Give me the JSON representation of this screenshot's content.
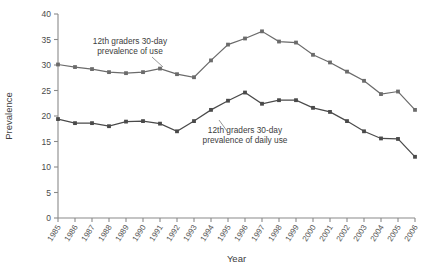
{
  "chart_data": {
    "type": "line",
    "title": "",
    "xlabel": "Year",
    "ylabel": "Prevalence",
    "x": [
      1985,
      1986,
      1987,
      1988,
      1989,
      1990,
      1991,
      1992,
      1993,
      1994,
      1995,
      1996,
      1997,
      1998,
      1999,
      2000,
      2001,
      2002,
      2003,
      2004,
      2005,
      2006
    ],
    "xtick_labels": [
      "1985",
      "1986",
      "1987",
      "1988",
      "1989",
      "1990",
      "1991",
      "1992",
      "1993",
      "1994",
      "1995",
      "1996",
      "1997",
      "1998",
      "1999",
      "2000",
      "2001",
      "2002",
      "2003",
      "2004",
      "2005",
      "2006"
    ],
    "ylim": [
      0,
      40
    ],
    "ytick_labels": [
      "0",
      "5",
      "10",
      "15",
      "20",
      "25",
      "30",
      "35",
      "40"
    ],
    "yticks": [
      0,
      5,
      10,
      15,
      20,
      25,
      30,
      35,
      40
    ],
    "grid": false,
    "legend": "annotations",
    "series": [
      {
        "name": "12th graders 30-day prevalence of use",
        "color": "#6b6b6b",
        "values": [
          30.1,
          29.6,
          29.2,
          28.6,
          28.4,
          28.6,
          29.3,
          28.2,
          27.6,
          30.9,
          34.0,
          35.2,
          36.6,
          34.6,
          34.4,
          32.0,
          30.5,
          28.7,
          26.9,
          24.3,
          24.8,
          21.2
        ]
      },
      {
        "name": "12th graders 30-day prevalence of daily use",
        "color": "#4a4a4a",
        "values": [
          19.4,
          18.6,
          18.6,
          18.0,
          18.9,
          19.0,
          18.5,
          17.0,
          19.0,
          21.2,
          23.0,
          24.6,
          22.4,
          23.1,
          23.1,
          21.6,
          20.8,
          19.0,
          17.0,
          15.6,
          15.5,
          12.0
        ]
      }
    ],
    "annotations": [
      {
        "text_line1": "12th graders 30-day",
        "text_line2": "prevalence of use",
        "target_series": 0,
        "target_index": 7
      },
      {
        "text_line1": "12th graders 30-day",
        "text_line2": "prevalence of daily use",
        "target_series": 1,
        "target_index": 10
      }
    ]
  }
}
